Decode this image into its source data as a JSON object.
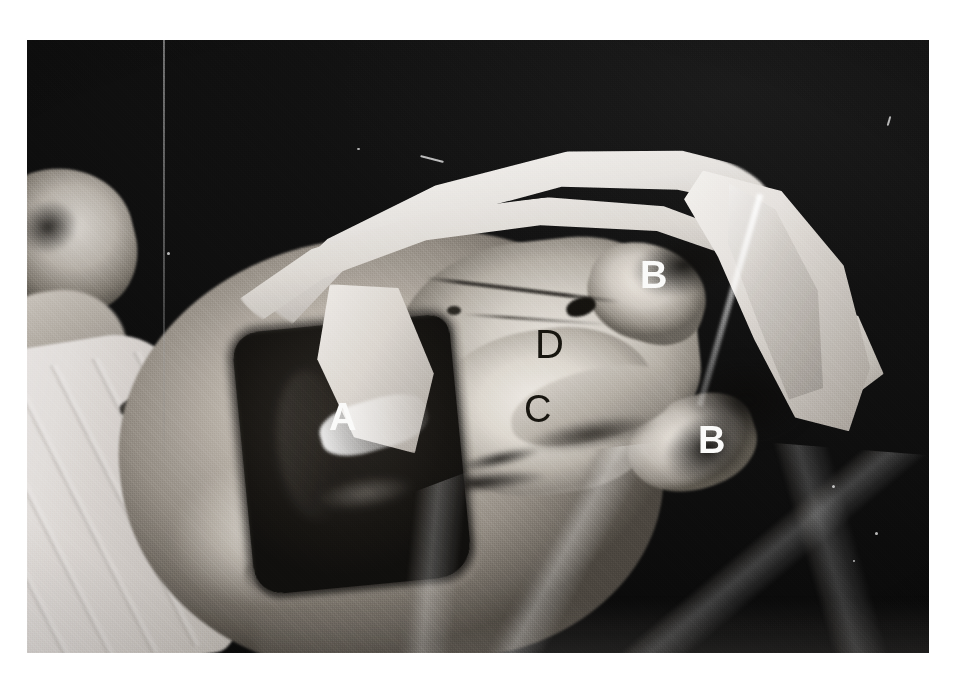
{
  "figure": {
    "panel_tag": "(a)",
    "kind": "black-and-white photographic halftone plate",
    "callouts": [
      {
        "id": "A",
        "label": "A",
        "tone": "light",
        "x": 302,
        "y": 358,
        "note": "dark rectangular operative window / wound"
      },
      {
        "id": "B1",
        "label": "B",
        "tone": "light",
        "x": 613,
        "y": 216,
        "note": "upper retracted flap"
      },
      {
        "id": "B2",
        "label": "B",
        "tone": "light",
        "x": 671,
        "y": 381,
        "note": "lower retracted flap"
      },
      {
        "id": "C",
        "label": "C",
        "tone": "dark",
        "x": 497,
        "y": 350,
        "note": "lower exposed tissue"
      },
      {
        "id": "D",
        "label": "D",
        "tone": "dark",
        "x": 508,
        "y": 284,
        "note": "upper exposed tissue"
      }
    ],
    "colors": {
      "page_background": "#ffffff",
      "plate_background": "#0d0d0d",
      "callout_light": "#fbfbfa",
      "callout_dark": "#17150f",
      "panel_tag_background": "#fbfbfa",
      "panel_tag_text": "#131313",
      "drape_white": "#f3f1ee",
      "tissue_midtone": "#bab3aa",
      "wound_dark": "#171512"
    },
    "plate": {
      "x": 27,
      "y": 40,
      "width": 902,
      "height": 613
    }
  }
}
